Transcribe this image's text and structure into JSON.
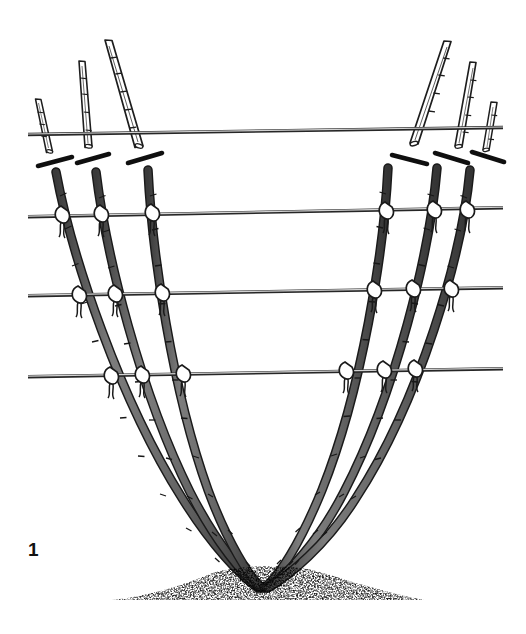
{
  "figure": {
    "number_label": "1",
    "background_color": "#ffffff",
    "width": 526,
    "height": 634,
    "ink_color": "#1a1a1a",
    "cane_fill_color": "#6b6b6b",
    "cane_outline_color": "#1a1a1a",
    "cut_cane_fill_color": "#ffffff",
    "wire_color": "#555555",
    "wire_highlight_color": "#bdbdbd",
    "tie_color": "#ffffff",
    "soil_color": "#2b2b2b"
  },
  "wires": [
    {
      "name": "wire-1-top",
      "left_x": 28,
      "left_y": 134,
      "right_x": 503,
      "right_y": 127
    },
    {
      "name": "wire-2",
      "left_x": 28,
      "left_y": 216,
      "right_x": 503,
      "right_y": 207
    },
    {
      "name": "wire-3",
      "left_x": 28,
      "left_y": 295,
      "right_x": 503,
      "right_y": 287
    },
    {
      "name": "wire-4-bottom",
      "left_x": 28,
      "left_y": 376,
      "right_x": 503,
      "right_y": 368
    }
  ],
  "cut_cane_tops": [
    {
      "name": "cut-top-left-1",
      "top_x": 37,
      "top_y": 100,
      "bottom_x": 50,
      "bottom_y": 152
    },
    {
      "name": "cut-top-left-2",
      "top_x": 82,
      "top_y": 62,
      "bottom_x": 87,
      "bottom_y": 148
    },
    {
      "name": "cut-top-left-3",
      "top_x": 109,
      "top_y": 41,
      "bottom_x": 140,
      "bottom_y": 149
    },
    {
      "name": "cut-top-right-1",
      "top_x": 448,
      "top_y": 42,
      "bottom_x": 412,
      "bottom_y": 146
    },
    {
      "name": "cut-top-right-2",
      "top_x": 473,
      "top_y": 63,
      "bottom_x": 458,
      "bottom_y": 148
    },
    {
      "name": "cut-top-right-3",
      "top_x": 493,
      "top_y": 103,
      "bottom_x": 487,
      "bottom_y": 150
    }
  ],
  "pruning_marks": [
    {
      "name": "prune-mark-left-1",
      "x1": 38,
      "y1": 166,
      "x2": 72,
      "y2": 157
    },
    {
      "name": "prune-mark-left-2",
      "x1": 77,
      "y1": 163,
      "x2": 109,
      "y2": 154
    },
    {
      "name": "prune-mark-left-3",
      "x1": 128,
      "y1": 163,
      "x2": 162,
      "y2": 153
    },
    {
      "name": "prune-mark-right-1",
      "x1": 392,
      "y1": 155,
      "x2": 427,
      "y2": 164
    },
    {
      "name": "prune-mark-right-2",
      "x1": 435,
      "y1": 153,
      "x2": 468,
      "y2": 163
    },
    {
      "name": "prune-mark-right-3",
      "x1": 472,
      "y1": 152,
      "x2": 504,
      "y2": 162
    }
  ],
  "canes": [
    {
      "name": "cane-left-outer",
      "top_x": 56,
      "top_y": 172,
      "base_x": 258,
      "base_y": 588
    },
    {
      "name": "cane-left-middle",
      "top_x": 96,
      "top_y": 172,
      "base_x": 260,
      "base_y": 588
    },
    {
      "name": "cane-left-inner",
      "top_x": 148,
      "top_y": 170,
      "base_x": 262,
      "base_y": 588
    },
    {
      "name": "cane-right-inner",
      "top_x": 388,
      "top_y": 168,
      "base_x": 264,
      "base_y": 588
    },
    {
      "name": "cane-right-middle",
      "top_x": 437,
      "top_y": 168,
      "base_x": 266,
      "base_y": 588
    },
    {
      "name": "cane-right-outer",
      "top_x": 470,
      "top_y": 170,
      "base_x": 268,
      "base_y": 588
    }
  ],
  "ties": {
    "count": 24,
    "description": "string ties binding each cane to each of the three lower wires"
  },
  "soil": {
    "center_x": 265,
    "center_y": 583,
    "left_x": 115,
    "right_x": 420,
    "top_y": 562,
    "bottom_y": 602
  }
}
